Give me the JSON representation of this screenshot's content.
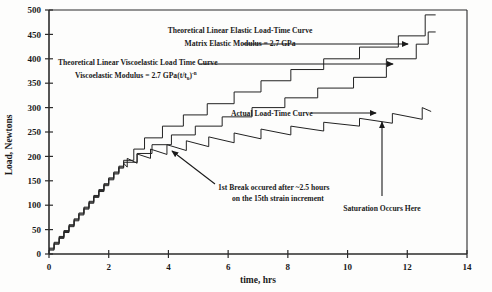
{
  "chart_data": {
    "type": "line",
    "title": "",
    "xlabel": "time, hrs",
    "ylabel": "Load, Newtons",
    "xlim": [
      0,
      14
    ],
    "ylim": [
      0,
      500
    ],
    "xticks": [
      0,
      2,
      4,
      6,
      8,
      10,
      12,
      14
    ],
    "yticks": [
      0,
      50,
      100,
      150,
      200,
      250,
      300,
      350,
      400,
      450,
      500
    ],
    "grid": false,
    "legend_position": "none",
    "series": [
      {
        "name": "Theoretical Linear Elastic Load-Time Curve",
        "style": "staircase",
        "points": [
          [
            0.0,
            12
          ],
          [
            0.17,
            12
          ],
          [
            0.17,
            24
          ],
          [
            0.34,
            24
          ],
          [
            0.34,
            36
          ],
          [
            0.5,
            36
          ],
          [
            0.5,
            48
          ],
          [
            0.67,
            48
          ],
          [
            0.67,
            60
          ],
          [
            0.84,
            60
          ],
          [
            0.84,
            72
          ],
          [
            1.0,
            72
          ],
          [
            1.0,
            84
          ],
          [
            1.17,
            84
          ],
          [
            1.17,
            96
          ],
          [
            1.34,
            96
          ],
          [
            1.34,
            108
          ],
          [
            1.5,
            108
          ],
          [
            1.5,
            120
          ],
          [
            1.67,
            120
          ],
          [
            1.67,
            132
          ],
          [
            1.84,
            132
          ],
          [
            1.84,
            144
          ],
          [
            2.0,
            144
          ],
          [
            2.0,
            156
          ],
          [
            2.17,
            156
          ],
          [
            2.17,
            168
          ],
          [
            2.34,
            168
          ],
          [
            2.34,
            180
          ],
          [
            2.5,
            180
          ],
          [
            2.5,
            192
          ],
          [
            2.84,
            192
          ],
          [
            2.84,
            215
          ],
          [
            3.2,
            215
          ],
          [
            3.2,
            238
          ],
          [
            3.8,
            238
          ],
          [
            3.8,
            262
          ],
          [
            4.5,
            262
          ],
          [
            4.5,
            285
          ],
          [
            5.3,
            285
          ],
          [
            5.3,
            308
          ],
          [
            6.2,
            308
          ],
          [
            6.2,
            332
          ],
          [
            7.1,
            332
          ],
          [
            7.1,
            355
          ],
          [
            8.1,
            355
          ],
          [
            8.1,
            378
          ],
          [
            9.2,
            378
          ],
          [
            9.2,
            400
          ],
          [
            10.4,
            400
          ],
          [
            10.4,
            424
          ],
          [
            11.7,
            424
          ],
          [
            11.7,
            447
          ],
          [
            12.6,
            447
          ],
          [
            12.6,
            490
          ],
          [
            12.95,
            490
          ]
        ]
      },
      {
        "name": "Theoretical Linear Viscoelastic Load Time Curve",
        "style": "staircase",
        "points": [
          [
            0.0,
            10
          ],
          [
            0.17,
            10
          ],
          [
            0.17,
            22
          ],
          [
            0.34,
            22
          ],
          [
            0.34,
            34
          ],
          [
            0.5,
            34
          ],
          [
            0.5,
            46
          ],
          [
            0.67,
            46
          ],
          [
            0.67,
            58
          ],
          [
            0.84,
            58
          ],
          [
            0.84,
            70
          ],
          [
            1.0,
            70
          ],
          [
            1.0,
            82
          ],
          [
            1.17,
            82
          ],
          [
            1.17,
            94
          ],
          [
            1.34,
            94
          ],
          [
            1.34,
            106
          ],
          [
            1.5,
            106
          ],
          [
            1.5,
            118
          ],
          [
            1.67,
            118
          ],
          [
            1.67,
            130
          ],
          [
            1.84,
            130
          ],
          [
            1.84,
            142
          ],
          [
            2.0,
            142
          ],
          [
            2.0,
            154
          ],
          [
            2.17,
            154
          ],
          [
            2.17,
            166
          ],
          [
            2.34,
            166
          ],
          [
            2.34,
            178
          ],
          [
            2.5,
            178
          ],
          [
            2.5,
            188
          ],
          [
            2.95,
            188
          ],
          [
            2.95,
            206
          ],
          [
            3.45,
            206
          ],
          [
            3.45,
            224
          ],
          [
            4.1,
            224
          ],
          [
            4.1,
            244
          ],
          [
            4.9,
            244
          ],
          [
            4.9,
            262
          ],
          [
            5.8,
            262
          ],
          [
            5.8,
            281
          ],
          [
            6.8,
            281
          ],
          [
            6.8,
            300
          ],
          [
            7.9,
            300
          ],
          [
            7.9,
            320
          ],
          [
            9.0,
            320
          ],
          [
            9.0,
            340
          ],
          [
            10.2,
            340
          ],
          [
            10.2,
            362
          ],
          [
            11.3,
            362
          ],
          [
            11.3,
            400
          ],
          [
            12.3,
            400
          ],
          [
            12.3,
            430
          ],
          [
            12.7,
            430
          ],
          [
            12.7,
            455
          ],
          [
            12.95,
            455
          ]
        ]
      },
      {
        "name": "Actual Load-Time Curve",
        "style": "sawtooth-relaxation",
        "points": [
          [
            0.0,
            8
          ],
          [
            0.17,
            8
          ],
          [
            0.17,
            20
          ],
          [
            0.34,
            20
          ],
          [
            0.34,
            32
          ],
          [
            0.5,
            32
          ],
          [
            0.5,
            44
          ],
          [
            0.67,
            44
          ],
          [
            0.67,
            56
          ],
          [
            0.84,
            56
          ],
          [
            0.84,
            68
          ],
          [
            1.0,
            68
          ],
          [
            1.0,
            80
          ],
          [
            1.17,
            80
          ],
          [
            1.17,
            92
          ],
          [
            1.34,
            92
          ],
          [
            1.34,
            104
          ],
          [
            1.5,
            104
          ],
          [
            1.5,
            116
          ],
          [
            1.67,
            116
          ],
          [
            1.67,
            128
          ],
          [
            1.84,
            128
          ],
          [
            1.84,
            140
          ],
          [
            2.0,
            140
          ],
          [
            2.0,
            152
          ],
          [
            2.17,
            152
          ],
          [
            2.17,
            164
          ],
          [
            2.34,
            164
          ],
          [
            2.34,
            176
          ],
          [
            2.5,
            176
          ],
          [
            2.5,
            186
          ],
          [
            2.62,
            178
          ],
          [
            2.62,
            196
          ],
          [
            2.95,
            186
          ],
          [
            2.95,
            205
          ],
          [
            3.4,
            196
          ],
          [
            3.4,
            215
          ],
          [
            3.95,
            204
          ],
          [
            3.95,
            224
          ],
          [
            4.6,
            212
          ],
          [
            4.6,
            232
          ],
          [
            5.35,
            220
          ],
          [
            5.35,
            240
          ],
          [
            6.2,
            228
          ],
          [
            6.2,
            248
          ],
          [
            7.1,
            236
          ],
          [
            7.1,
            256
          ],
          [
            8.1,
            244
          ],
          [
            8.1,
            262
          ],
          [
            9.2,
            252
          ],
          [
            9.2,
            270
          ],
          [
            10.4,
            262
          ],
          [
            10.4,
            278
          ],
          [
            11.5,
            268
          ],
          [
            11.5,
            288
          ],
          [
            12.5,
            276
          ],
          [
            12.5,
            300
          ],
          [
            12.8,
            292
          ]
        ]
      }
    ],
    "annotations": [
      {
        "id": "elastic-label",
        "lines": [
          "Theoretical Linear Elastic Load-Time Curve",
          "Matrix Elastic Modulus = 2.7 GPa"
        ]
      },
      {
        "id": "viscoelastic-label",
        "line1": "Theoretical Linear Viscoelastic Load Time Curve",
        "line2_prefix": "Viscoelastic Modulus = 2.7 GPa(t/t",
        "line2_sub": "o",
        "line2_mid": ")",
        "line2_sup": "-n"
      },
      {
        "id": "actual-label",
        "text": "Actual Load-Time Curve"
      },
      {
        "id": "first-break-label",
        "line1": "1st Break occured after ~2.5 hours",
        "line2": "on the 15th strain increment"
      },
      {
        "id": "saturation-label",
        "text": "Saturation Occurs Here"
      }
    ]
  },
  "colors": {
    "curve": "#222222",
    "axis": "#2b2b2b",
    "text": "#1a1a1a",
    "background": "#fdfdfc"
  }
}
